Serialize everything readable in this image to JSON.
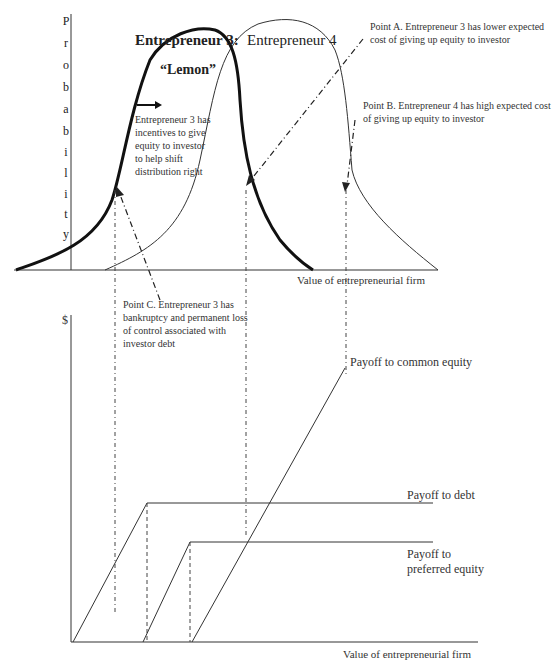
{
  "top_panel": {
    "y_axis_label_letters": [
      "P",
      "r",
      "o",
      "b",
      "a",
      "b",
      "i",
      "l",
      "i",
      "t",
      "y"
    ],
    "x_axis_label": "Value of entrepreneurial firm",
    "curve_labels": {
      "entrepreneur3": "Entrepreneur 3:",
      "entrepreneur4": "Entrepreneur 4",
      "lemon": "“Lemon”"
    },
    "notes": {
      "incentive": [
        "Entrepreneur 3 has",
        "incentives to give",
        "equity to investor",
        "to help shift",
        "distribution right"
      ],
      "point_a": [
        "Point A. Entrepreneur 3 has lower expected",
        "cost of giving up equity to investor"
      ],
      "point_b": [
        "Point B. Entrepreneur 4 has high expected cost",
        "of giving up equity to investor"
      ],
      "point_c": [
        "Point C. Entrepreneur 3 has",
        "bankruptcy and permanent loss",
        "of control associated with",
        "investor debt"
      ]
    }
  },
  "bottom_panel": {
    "y_axis_label": "$",
    "x_axis_label": "Value of entrepreneurial firm",
    "series_labels": {
      "common": "Payoff to common equity",
      "debt": "Payoff  to debt",
      "preferred": [
        "Payoff  to",
        "preferred equity"
      ]
    }
  },
  "colors": {
    "line": "#222222",
    "text": "#333333",
    "background": "#ffffff"
  }
}
